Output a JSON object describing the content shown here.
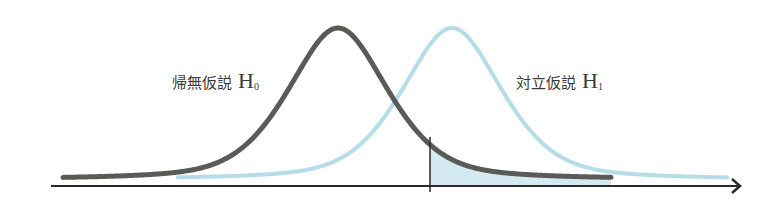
{
  "labels": {
    "h0": {
      "text": "帰無仮説",
      "symbol": "H",
      "subscript": "0"
    },
    "h1": {
      "text": "対立仮説",
      "symbol": "H",
      "subscript": "1"
    }
  },
  "colors": {
    "h0_curve": "#5a5a58",
    "h1_curve": "#b5dde8",
    "axis": "#2a2a2a",
    "shade": "#d3ebf0",
    "critical_line": "#2a2a2a"
  },
  "curves": {
    "baseline_y": 180,
    "peak_y": 28,
    "h0": {
      "center_x": 338,
      "sigma": 52,
      "start_x": 63,
      "end_x": 611
    },
    "h1": {
      "center_x": 452,
      "sigma": 52,
      "start_x": 178,
      "end_x": 727
    }
  },
  "axis": {
    "x_start": 51,
    "x_end": 740,
    "y": 186
  },
  "critical_value": {
    "x": 430,
    "y_top": 137,
    "y_bottom": 192
  }
}
